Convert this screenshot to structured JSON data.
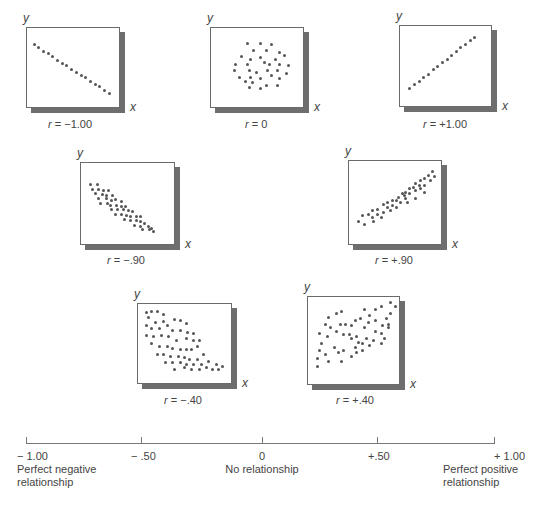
{
  "chart_data": {
    "type": "scatter",
    "axis_labels": {
      "x": "x",
      "y": "y"
    },
    "plots": [
      {
        "id": "r-neg-1",
        "label": "r = −1.00",
        "r": -1.0,
        "box": {
          "x": 26,
          "y": 27,
          "w": 94,
          "h": 81
        },
        "points": [
          [
            7,
            20
          ],
          [
            12,
            24
          ],
          [
            17,
            28
          ],
          [
            22,
            31
          ],
          [
            27,
            35
          ],
          [
            32,
            39
          ],
          [
            37,
            43
          ],
          [
            42,
            46
          ],
          [
            47,
            50
          ],
          [
            52,
            54
          ],
          [
            57,
            58
          ],
          [
            62,
            61
          ],
          [
            67,
            65
          ],
          [
            72,
            69
          ],
          [
            77,
            72
          ],
          [
            82,
            76
          ],
          [
            87,
            80
          ]
        ]
      },
      {
        "id": "r-0",
        "label": "r = 0",
        "r": 0,
        "box": {
          "x": 210,
          "y": 27,
          "w": 94,
          "h": 81
        },
        "points": [
          [
            38,
            18
          ],
          [
            52,
            18
          ],
          [
            64,
            20
          ],
          [
            45,
            27
          ],
          [
            58,
            27
          ],
          [
            72,
            30
          ],
          [
            32,
            35
          ],
          [
            42,
            38
          ],
          [
            52,
            36
          ],
          [
            68,
            38
          ],
          [
            78,
            33
          ],
          [
            26,
            45
          ],
          [
            38,
            45
          ],
          [
            56,
            42
          ],
          [
            62,
            45
          ],
          [
            72,
            44
          ],
          [
            82,
            46
          ],
          [
            24,
            52
          ],
          [
            40,
            52
          ],
          [
            48,
            54
          ],
          [
            60,
            52
          ],
          [
            70,
            52
          ],
          [
            80,
            55
          ],
          [
            30,
            60
          ],
          [
            42,
            60
          ],
          [
            52,
            62
          ],
          [
            64,
            58
          ],
          [
            72,
            62
          ],
          [
            44,
            67
          ],
          [
            36,
            65
          ],
          [
            58,
            70
          ],
          [
            70,
            70
          ],
          [
            40,
            73
          ],
          [
            52,
            74
          ]
        ]
      },
      {
        "id": "r-pos-1",
        "label": "r = +1.00",
        "r": 1.0,
        "box": {
          "x": 399,
          "y": 25,
          "w": 93,
          "h": 82
        },
        "points": [
          [
            10,
            76
          ],
          [
            15,
            71
          ],
          [
            20,
            67
          ],
          [
            25,
            62
          ],
          [
            30,
            58
          ],
          [
            35,
            53
          ],
          [
            40,
            49
          ],
          [
            45,
            44
          ],
          [
            50,
            40
          ],
          [
            55,
            35
          ],
          [
            60,
            31
          ],
          [
            65,
            26
          ],
          [
            70,
            22
          ],
          [
            75,
            17
          ],
          [
            80,
            13
          ]
        ]
      },
      {
        "id": "r-neg-90",
        "label": "r = −.90",
        "r": -0.9,
        "box": {
          "x": 80,
          "y": 162,
          "w": 95,
          "h": 83
        },
        "points": [
          [
            9,
            25
          ],
          [
            17,
            25
          ],
          [
            12,
            31
          ],
          [
            18,
            31
          ],
          [
            23,
            32
          ],
          [
            28,
            32
          ],
          [
            15,
            36
          ],
          [
            22,
            37
          ],
          [
            26,
            38
          ],
          [
            33,
            38
          ],
          [
            18,
            42
          ],
          [
            26,
            42
          ],
          [
            32,
            44
          ],
          [
            36,
            43
          ],
          [
            42,
            46
          ],
          [
            20,
            48
          ],
          [
            27,
            48
          ],
          [
            30,
            50
          ],
          [
            37,
            50
          ],
          [
            42,
            52
          ],
          [
            46,
            52
          ],
          [
            32,
            56
          ],
          [
            38,
            55
          ],
          [
            44,
            56
          ],
          [
            49,
            57
          ],
          [
            54,
            58
          ],
          [
            36,
            61
          ],
          [
            42,
            62
          ],
          [
            47,
            63
          ],
          [
            52,
            64
          ],
          [
            58,
            64
          ],
          [
            62,
            64
          ],
          [
            45,
            68
          ],
          [
            52,
            69
          ],
          [
            58,
            69
          ],
          [
            62,
            70
          ],
          [
            66,
            72
          ],
          [
            56,
            75
          ],
          [
            62,
            76
          ],
          [
            70,
            76
          ],
          [
            74,
            78
          ],
          [
            64,
            80
          ],
          [
            72,
            80
          ],
          [
            76,
            82
          ]
        ]
      },
      {
        "id": "r-pos-90",
        "label": "r = +.90",
        "r": 0.9,
        "box": {
          "x": 348,
          "y": 160,
          "w": 94,
          "h": 85
        },
        "points": [
          [
            10,
            70
          ],
          [
            16,
            74
          ],
          [
            14,
            64
          ],
          [
            20,
            62
          ],
          [
            24,
            66
          ],
          [
            24,
            58
          ],
          [
            30,
            56
          ],
          [
            30,
            62
          ],
          [
            36,
            60
          ],
          [
            36,
            50
          ],
          [
            40,
            54
          ],
          [
            40,
            48
          ],
          [
            46,
            52
          ],
          [
            46,
            46
          ],
          [
            50,
            46
          ],
          [
            52,
            42
          ],
          [
            54,
            48
          ],
          [
            56,
            38
          ],
          [
            58,
            40
          ],
          [
            60,
            44
          ],
          [
            60,
            36
          ],
          [
            64,
            32
          ],
          [
            64,
            38
          ],
          [
            68,
            30
          ],
          [
            70,
            34
          ],
          [
            70,
            26
          ],
          [
            74,
            28
          ],
          [
            76,
            32
          ],
          [
            76,
            22
          ],
          [
            80,
            20
          ],
          [
            80,
            28
          ],
          [
            84,
            16
          ],
          [
            86,
            22
          ],
          [
            88,
            12
          ],
          [
            80,
            36
          ],
          [
            70,
            44
          ],
          [
            62,
            48
          ],
          [
            50,
            54
          ],
          [
            44,
            58
          ],
          [
            34,
            66
          ],
          [
            26,
            70
          ],
          [
            90,
            18
          ]
        ]
      },
      {
        "id": "r-neg-40",
        "label": "r = −.40",
        "r": -0.4,
        "box": {
          "x": 137,
          "y": 303,
          "w": 95,
          "h": 81
        },
        "points": [
          [
            8,
            10
          ],
          [
            14,
            9
          ],
          [
            20,
            9
          ],
          [
            26,
            12
          ],
          [
            10,
            16
          ],
          [
            18,
            22
          ],
          [
            26,
            21
          ],
          [
            38,
            18
          ],
          [
            44,
            20
          ],
          [
            50,
            24
          ],
          [
            8,
            26
          ],
          [
            14,
            30
          ],
          [
            22,
            30
          ],
          [
            30,
            26
          ],
          [
            36,
            32
          ],
          [
            44,
            32
          ],
          [
            52,
            34
          ],
          [
            58,
            36
          ],
          [
            8,
            38
          ],
          [
            16,
            40
          ],
          [
            24,
            38
          ],
          [
            32,
            40
          ],
          [
            40,
            44
          ],
          [
            50,
            42
          ],
          [
            58,
            44
          ],
          [
            64,
            44
          ],
          [
            14,
            48
          ],
          [
            22,
            52
          ],
          [
            30,
            52
          ],
          [
            36,
            54
          ],
          [
            44,
            56
          ],
          [
            50,
            56
          ],
          [
            56,
            56
          ],
          [
            62,
            52
          ],
          [
            20,
            62
          ],
          [
            26,
            62
          ],
          [
            34,
            64
          ],
          [
            42,
            64
          ],
          [
            48,
            66
          ],
          [
            54,
            68
          ],
          [
            62,
            68
          ],
          [
            68,
            62
          ],
          [
            28,
            72
          ],
          [
            36,
            72
          ],
          [
            44,
            72
          ],
          [
            50,
            74
          ],
          [
            58,
            74
          ],
          [
            66,
            74
          ],
          [
            74,
            70
          ],
          [
            82,
            74
          ],
          [
            38,
            80
          ],
          [
            48,
            78
          ],
          [
            56,
            80
          ],
          [
            64,
            80
          ],
          [
            72,
            78
          ],
          [
            78,
            80
          ],
          [
            84,
            80
          ],
          [
            88,
            76
          ]
        ]
      },
      {
        "id": "r-pos-40",
        "label": "r = +.40",
        "r": 0.4,
        "box": {
          "x": 307,
          "y": 296,
          "w": 93,
          "h": 89
        },
        "points": [
          [
            10,
            78
          ],
          [
            10,
            68
          ],
          [
            12,
            60
          ],
          [
            18,
            64
          ],
          [
            22,
            72
          ],
          [
            14,
            52
          ],
          [
            28,
            56
          ],
          [
            32,
            62
          ],
          [
            36,
            72
          ],
          [
            38,
            60
          ],
          [
            46,
            66
          ],
          [
            50,
            56
          ],
          [
            52,
            62
          ],
          [
            58,
            60
          ],
          [
            12,
            40
          ],
          [
            20,
            44
          ],
          [
            24,
            34
          ],
          [
            30,
            38
          ],
          [
            34,
            30
          ],
          [
            38,
            42
          ],
          [
            44,
            42
          ],
          [
            46,
            46
          ],
          [
            52,
            44
          ],
          [
            54,
            50
          ],
          [
            58,
            52
          ],
          [
            62,
            46
          ],
          [
            66,
            54
          ],
          [
            70,
            48
          ],
          [
            72,
            38
          ],
          [
            78,
            40
          ],
          [
            82,
            46
          ],
          [
            80,
            32
          ],
          [
            86,
            30
          ],
          [
            86,
            34
          ],
          [
            88,
            18
          ],
          [
            64,
            28
          ],
          [
            60,
            34
          ],
          [
            50,
            26
          ],
          [
            56,
            24
          ],
          [
            60,
            14
          ],
          [
            66,
            20
          ],
          [
            72,
            14
          ],
          [
            78,
            10
          ],
          [
            84,
            24
          ],
          [
            88,
            6
          ],
          [
            94,
            10
          ],
          [
            22,
            22
          ],
          [
            30,
            18
          ],
          [
            36,
            16
          ],
          [
            40,
            30
          ],
          [
            46,
            32
          ],
          [
            72,
            26
          ],
          [
            78,
            52
          ],
          [
            18,
            30
          ]
        ]
      }
    ],
    "scale": {
      "ticks": [
        {
          "value": -1.0,
          "label": "− 1.00",
          "desc": "Perfect negative relationship"
        },
        {
          "value": -0.5,
          "label": "− .50",
          "desc": ""
        },
        {
          "value": 0,
          "label": "0",
          "desc": "No relationship"
        },
        {
          "value": 0.5,
          "label": "+.50",
          "desc": ""
        },
        {
          "value": 1.0,
          "label": "+ 1.00",
          "desc": "Perfect positive relationship"
        }
      ]
    }
  },
  "labels": {
    "x": "x",
    "y": "y"
  },
  "plots": [
    {
      "r_text": "= −1.00"
    },
    {
      "r_text": "= 0"
    },
    {
      "r_text": "= +1.00"
    },
    {
      "r_text": "= −.90"
    },
    {
      "r_text": "= +.90"
    },
    {
      "r_text": "= −.40"
    },
    {
      "r_text": "= +.40"
    }
  ],
  "scale": {
    "t0": "− 1.00",
    "t1": "− .50",
    "t2": "0",
    "t3": "+.50",
    "t4": "+ 1.00",
    "d0_line1": "Perfect negative",
    "d0_line2": "relationship",
    "d2": "No relationship",
    "d4_line1": "Perfect positive",
    "d4_line2": "relationship"
  }
}
